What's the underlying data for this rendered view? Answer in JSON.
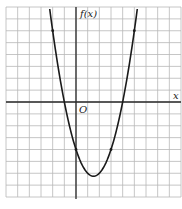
{
  "chart_data": {
    "type": "line",
    "title": "",
    "xlabel": "x",
    "ylabel": "f(x)",
    "origin_label": "O",
    "function": "f(x) = x^2 - 3x - 4",
    "xlim": [
      -6,
      9
    ],
    "ylim": [
      -8,
      8
    ],
    "grid": true,
    "grid_step": 1,
    "series": [
      {
        "name": "f(x)",
        "x": [
          -2.4,
          -2,
          -1,
          0,
          1,
          1.5,
          2,
          3,
          4,
          5,
          5.4
        ],
        "values": [
          8.96,
          6,
          0,
          -4,
          -6,
          -6.25,
          -6,
          -4,
          0,
          6,
          8.96
        ]
      }
    ],
    "marked_points": [
      {
        "x": -2,
        "y": 6
      },
      {
        "x": 0,
        "y": -4
      },
      {
        "x": 3,
        "y": -4
      },
      {
        "x": 5,
        "y": 6
      }
    ],
    "x_intercepts": [
      -1,
      4
    ],
    "y_intercept": -4,
    "vertex": {
      "x": 1.5,
      "y": -6.25
    }
  },
  "colors": {
    "grid": "#b8b8b8",
    "axis": "#2a2a2a",
    "curve": "#1a1a1a"
  }
}
